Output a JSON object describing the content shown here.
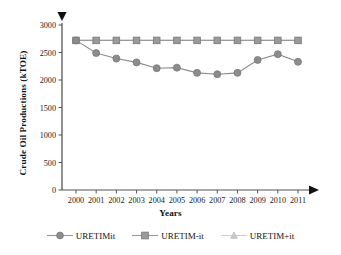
{
  "chart_data": {
    "type": "line",
    "title": "",
    "xlabel": "Years",
    "ylabel": "Crude Oil Productions (kTOE)",
    "categories": [
      "2000",
      "2001",
      "2002",
      "2003",
      "2004",
      "2005",
      "2006",
      "2007",
      "2008",
      "2009",
      "2010",
      "2011"
    ],
    "x": [
      2000,
      2001,
      2002,
      2003,
      2004,
      2005,
      2006,
      2007,
      2008,
      2009,
      2010,
      2011
    ],
    "ylim": [
      0,
      3000
    ],
    "yticks": [
      0,
      500,
      1000,
      1500,
      2000,
      2500,
      3000
    ],
    "ytick_labels": [
      "0",
      "500",
      "1000",
      "1500",
      "2000",
      "2500",
      "3000"
    ],
    "grid": false,
    "legend_position": "bottom",
    "series": [
      {
        "name": "URETIMit",
        "marker": "circle",
        "color": "#8c8c8c",
        "values": [
          2720,
          2490,
          2390,
          2320,
          2215,
          2225,
          2130,
          2105,
          2130,
          2365,
          2470,
          2330
        ]
      },
      {
        "name": "URETIM-it",
        "marker": "square",
        "color": "#9a9a9a",
        "values": [
          2720,
          2720,
          2720,
          2720,
          2720,
          2720,
          2720,
          2720,
          2720,
          2720,
          2720,
          2720
        ]
      },
      {
        "name": "URETIM+it",
        "marker": "triangle",
        "color": "#c8c8c8",
        "values": [
          2720,
          2720,
          2720,
          2720,
          2720,
          2720,
          2720,
          2720,
          2720,
          2720,
          2720,
          2720
        ]
      }
    ]
  },
  "axes": {
    "y_axis_arrow": "down-triangle",
    "x_axis_arrow": "right-triangle"
  },
  "legend": {
    "entries": [
      {
        "label": "URETIMit",
        "marker": "circle-marker-icon"
      },
      {
        "label": "URETIM-it",
        "marker": "square-marker-icon"
      },
      {
        "label": "URETIM+it",
        "marker": "triangle-marker-icon"
      }
    ]
  },
  "colors": {
    "series_primary": "#8c8c8c",
    "series_secondary": "#9a9a9a",
    "series_tertiary": "#c8c8c8",
    "axis": "#555555",
    "text": "#111111"
  }
}
